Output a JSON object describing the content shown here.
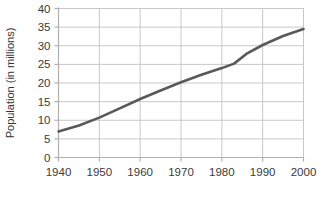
{
  "chart_data": {
    "type": "line",
    "title": "",
    "subtitle": "",
    "xlabel": "",
    "ylabel": "Population (in millions)",
    "xlim": [
      1940,
      2000
    ],
    "ylim": [
      0,
      40
    ],
    "grid": true,
    "legend": false,
    "legend_position": "none",
    "line_color": "#595959",
    "grid_color": "#c8c8c8",
    "axis_color": "#b0b0b0",
    "x_ticks": [
      1940,
      1950,
      1960,
      1970,
      1980,
      1990,
      2000
    ],
    "x_tick_labels": [
      "1940",
      "1950",
      "1960",
      "1970",
      "1980",
      "1990",
      "2000"
    ],
    "y_ticks": [
      0,
      5,
      10,
      15,
      20,
      25,
      30,
      35,
      40
    ],
    "y_tick_labels": [
      "0",
      "5",
      "10",
      "15",
      "20",
      "25",
      "30",
      "35",
      "40"
    ],
    "series": [
      {
        "name": "Population",
        "x": [
          1940,
          1945,
          1950,
          1955,
          1960,
          1965,
          1970,
          1975,
          1980,
          1983,
          1986,
          1990,
          1995,
          2000
        ],
        "values": [
          7.0,
          8.6,
          10.7,
          13.2,
          15.7,
          18.0,
          20.2,
          22.2,
          24.0,
          25.2,
          27.8,
          30.2,
          32.6,
          34.5
        ]
      }
    ],
    "annotations": []
  }
}
